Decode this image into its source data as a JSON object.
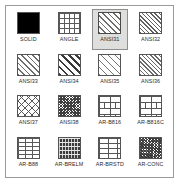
{
  "panel": {
    "name": "hatch-pattern-palette",
    "background_color": "#ffffff",
    "border_color": "#9a9a9a",
    "selection_fill_color": "#dededc",
    "selection_border_color": "#8e8e8e",
    "columns": 4,
    "rows": 4
  },
  "patterns": [
    {
      "label": "SOLID",
      "fill": "p-solid",
      "selected": false
    },
    {
      "label": "ANGLE",
      "fill": "p-angle",
      "selected": false
    },
    {
      "label": "ANSI31",
      "fill": "p-ansi31",
      "selected": true
    },
    {
      "label": "ANSI32",
      "fill": "p-ansi32",
      "selected": false
    },
    {
      "label": "ANSI33",
      "fill": "p-ansi33",
      "selected": false
    },
    {
      "label": "ANSI34",
      "fill": "p-ansi34",
      "selected": false
    },
    {
      "label": "ANSI35",
      "fill": "p-ansi35",
      "selected": false
    },
    {
      "label": "ANSI36",
      "fill": "p-ansi36",
      "selected": false
    },
    {
      "label": "ANSI37",
      "fill": "p-ansi37",
      "selected": false
    },
    {
      "label": "ANSI38",
      "fill": "p-ansi38",
      "selected": false
    },
    {
      "label": "AR-B816",
      "fill": "p-brick-lg",
      "selected": false
    },
    {
      "label": "AR-B816C",
      "fill": "p-brick-lg",
      "selected": false
    },
    {
      "label": "AR-B88",
      "fill": "p-brick-sm",
      "selected": false
    },
    {
      "label": "AR-BRELM",
      "fill": "p-brelm",
      "selected": false
    },
    {
      "label": "AR-BRSTD",
      "fill": "p-brick-std",
      "selected": false
    },
    {
      "label": "AR-CONC",
      "fill": "p-conc",
      "selected": false
    }
  ]
}
